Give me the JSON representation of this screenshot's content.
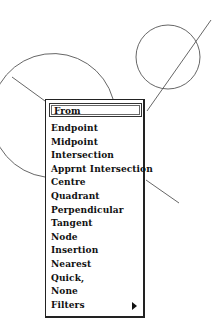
{
  "drawing": {
    "stroke_color": "#555555",
    "circle": {
      "cx": 168,
      "cy": 57,
      "r": 32
    },
    "arc": {
      "cx": 73,
      "cy": 150,
      "r": 62
    },
    "lines": [
      {
        "x1": 12,
        "y1": 77,
        "x2": 45,
        "y2": 101
      },
      {
        "x1": 211,
        "y1": 20,
        "x2": 147,
        "y2": 111
      },
      {
        "x1": 146,
        "y1": 180,
        "x2": 179,
        "y2": 203
      }
    ]
  },
  "menu": {
    "from_field": "From",
    "items": [
      {
        "label": "Endpoint"
      },
      {
        "label": "Midpoint"
      },
      {
        "label": "Intersection"
      },
      {
        "label": "Apprnt Intersection"
      },
      {
        "label": "Centre"
      },
      {
        "label": "Quadrant"
      },
      {
        "label": "Perpendicular"
      },
      {
        "label": "Tangent"
      },
      {
        "label": "Node"
      },
      {
        "label": "Insertion"
      },
      {
        "label": "Nearest"
      },
      {
        "label": "Quick,"
      },
      {
        "label": "None"
      },
      {
        "label": "Filters",
        "submenu": true,
        "submenu_icon": "triangle-right-icon"
      }
    ]
  }
}
